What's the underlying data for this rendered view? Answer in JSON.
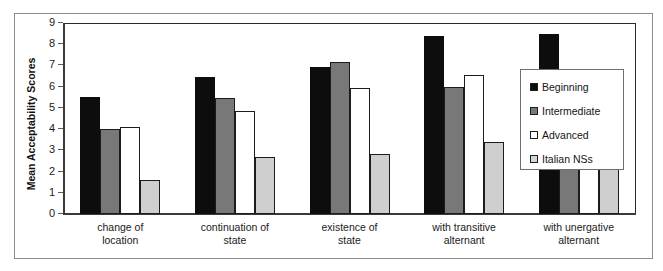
{
  "chart_data": {
    "type": "bar",
    "title": "",
    "subtitle": "",
    "xlabel": "",
    "ylabel": "Mean Acceptability Scores",
    "ylim": [
      0,
      9
    ],
    "yticks": [
      0,
      1,
      2,
      3,
      4,
      5,
      6,
      7,
      8,
      9
    ],
    "ytick_labels": [
      "0",
      "1",
      "2",
      "3",
      "4",
      "5",
      "6",
      "7",
      "8",
      "9"
    ],
    "grid": false,
    "legend_position": "right",
    "categories": [
      "change of location",
      "continuation of state",
      "existence of state",
      "with transitive alternant",
      "with unergative alternant"
    ],
    "category_lines": [
      [
        "change of",
        "location"
      ],
      [
        "continuation of",
        "state"
      ],
      [
        "existence of",
        "state"
      ],
      [
        "with transitive",
        "alternant"
      ],
      [
        "with unergative",
        "alternant"
      ]
    ],
    "series": [
      {
        "name": "Beginning",
        "color": "#0d0d0d",
        "values": [
          5.5,
          6.45,
          6.95,
          8.4,
          8.5
        ]
      },
      {
        "name": "Intermediate",
        "color": "#787878",
        "values": [
          4.0,
          5.45,
          7.15,
          6.0,
          6.3
        ]
      },
      {
        "name": "Advanced",
        "color": "#ffffff",
        "values": [
          4.1,
          4.85,
          5.95,
          6.55,
          6.0
        ]
      },
      {
        "name": "Italian NSs",
        "color": "#cfcfcf",
        "values": [
          1.6,
          2.7,
          2.85,
          3.4,
          4.3
        ]
      }
    ]
  },
  "legend": {
    "entries": [
      {
        "label": "Beginning",
        "swatch": "legend-swatch-black"
      },
      {
        "label": "Intermediate",
        "swatch": "legend-swatch-dark-gray"
      },
      {
        "label": "Advanced",
        "swatch": "legend-swatch-white"
      },
      {
        "label": "Italian NSs",
        "swatch": "legend-swatch-light-gray"
      }
    ]
  },
  "axis": {
    "y_title": "Mean Acceptability Scores",
    "y_tick_labels": [
      "9",
      "8",
      "7",
      "6",
      "5",
      "4",
      "3",
      "2",
      "1",
      "0"
    ]
  },
  "colors": {
    "beginning": "#0d0d0d",
    "intermediate": "#787878",
    "advanced": "#ffffff",
    "italian_ns": "#cfcfcf",
    "axis": "#3a3a3a",
    "frame": "#8d8d8d",
    "text": "#1a1a1a"
  }
}
